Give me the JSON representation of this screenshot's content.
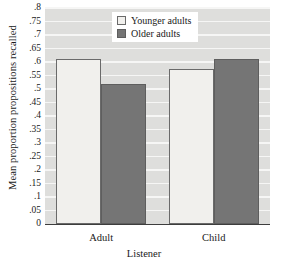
{
  "chart_data": {
    "type": "bar",
    "title": "",
    "xlabel": "Listener",
    "ylabel": "Mean proportion propositions recalled",
    "categories": [
      "Adult",
      "Child"
    ],
    "series": [
      {
        "name": "Younger adults",
        "values": [
          0.61,
          0.575
        ],
        "color": "#f1f0ed"
      },
      {
        "name": "Older adults",
        "values": [
          0.52,
          0.61
        ],
        "color": "#757575"
      }
    ],
    "ylim": [
      0,
      0.8
    ],
    "ytick_labels": [
      ".8",
      ".75",
      ".7",
      ".65",
      ".6",
      ".55",
      ".5",
      ".45",
      ".4",
      ".35",
      ".3",
      ".25",
      ".2",
      ".15",
      ".1",
      ".05",
      "0"
    ],
    "ytick_values": [
      0.8,
      0.75,
      0.7,
      0.65,
      0.6,
      0.55,
      0.5,
      0.45,
      0.4,
      0.35,
      0.3,
      0.25,
      0.2,
      0.15,
      0.1,
      0.05,
      0
    ],
    "grid": true,
    "legend_position": "top-center",
    "plot_background": "#dededc",
    "gridline_color": "#f6f6f5"
  },
  "legend": {
    "items": [
      {
        "label": "Younger adults",
        "swatch": "light"
      },
      {
        "label": "Older adults",
        "swatch": "dark"
      }
    ]
  }
}
